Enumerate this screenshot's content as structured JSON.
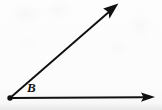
{
  "figure": {
    "kind": "geometry-angle-diagram",
    "background_color": "#fdfdfd",
    "ink_color": "#101010",
    "vertex": {
      "label": "B",
      "label_style": "bold-italic",
      "point_marker": "filled-dot",
      "x": 10,
      "y": 98,
      "dot_radius": 2.6
    },
    "rays": [
      {
        "name": "horizontal-ray",
        "from": {
          "x": 10,
          "y": 98
        },
        "to": {
          "x": 155,
          "y": 97
        },
        "arrowhead": "end",
        "direction_label": "right",
        "stroke_width": 1.9
      },
      {
        "name": "diagonal-ray",
        "from": {
          "x": 10,
          "y": 98
        },
        "to": {
          "x": 118,
          "y": 4
        },
        "arrowhead": "end",
        "direction_label": "up-right",
        "stroke_width": 1.9
      }
    ],
    "angle": {
      "vertex_label": "B",
      "measure_degrees": 41,
      "opening": "between horizontal ray and diagonal ray",
      "arc_drawn": false
    },
    "canvas": {
      "width": 162,
      "height": 110
    }
  }
}
